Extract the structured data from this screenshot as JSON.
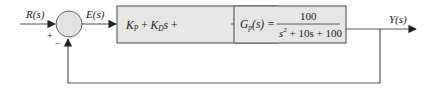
{
  "diagram": {
    "colors": {
      "line": "#555555",
      "block_fill": "#e6e6e6",
      "block_stroke": "#666666",
      "junction_fill": "#e3e3e3",
      "text": "#222222"
    },
    "signals": {
      "input": "R(s)",
      "error": "E(s)",
      "output": "Y(s)"
    },
    "summing_junction": {
      "plus_sign": "+",
      "minus_sign": "−"
    },
    "controller_block": {
      "term1": "K",
      "term1_sub": "P",
      "plus1": " + ",
      "term2": "K",
      "term2_sub": "D",
      "term2_var": "s",
      "plus2": " + ",
      "frac_num": "K",
      "frac_num_sub": "I",
      "frac_den": "s"
    },
    "plant_block": {
      "name": "G",
      "name_sub": "p",
      "arg": "(s) =",
      "numerator": "100",
      "den_s": "s",
      "den_exp": "2",
      "den_rest": " + 10s + 100"
    }
  }
}
